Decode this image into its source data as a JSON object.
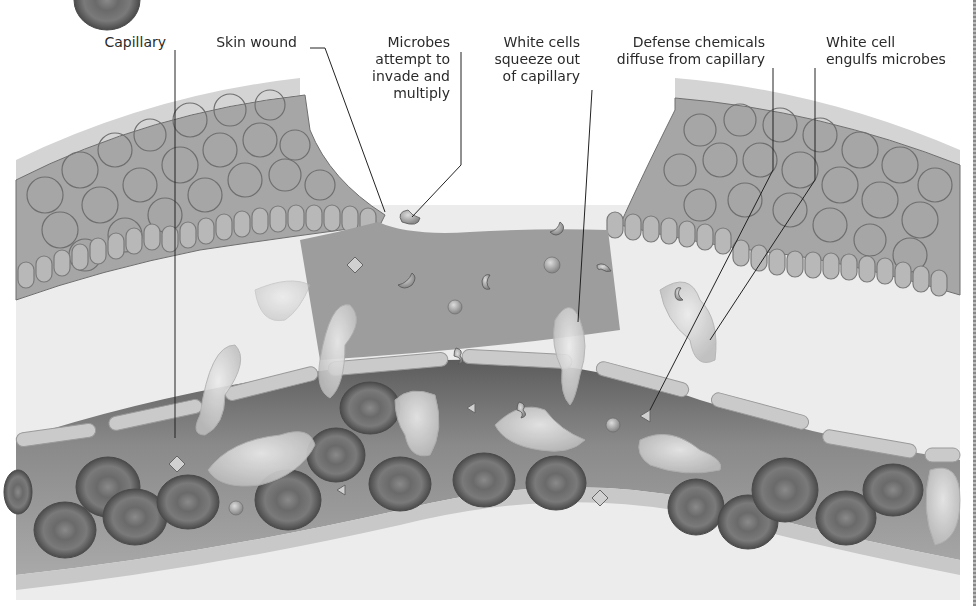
{
  "figure": {
    "colors": {
      "skin_outer": "#d6d6d6",
      "skin_cells": "#a9a9a9",
      "cell_border": "#6f6f6f",
      "tissue": "#e9e9e9",
      "wound_fluid": "#9c9c9c",
      "capillary_lumen": "#7d7d7d",
      "capillary_wall": "#c4c4c4",
      "red_blood_cell": "#6a6a6a",
      "white_cell": "#d8d8d8",
      "leader_line": "#222222"
    }
  },
  "labels": {
    "capillary": {
      "lines": [
        "Capillary"
      ]
    },
    "skin_wound": {
      "lines": [
        "Skin wound"
      ]
    },
    "microbes": {
      "lines": [
        "Microbes",
        "attempt to",
        "invade and",
        "multiply"
      ]
    },
    "white_cells_squeeze": {
      "lines": [
        "White cells",
        "squeeze out",
        "of capillary"
      ]
    },
    "defense_chemicals": {
      "lines": [
        "Defense chemicals",
        "diffuse from capillary"
      ]
    },
    "white_cell_engulfs": {
      "lines": [
        "White cell",
        "engulfs microbes"
      ]
    }
  }
}
